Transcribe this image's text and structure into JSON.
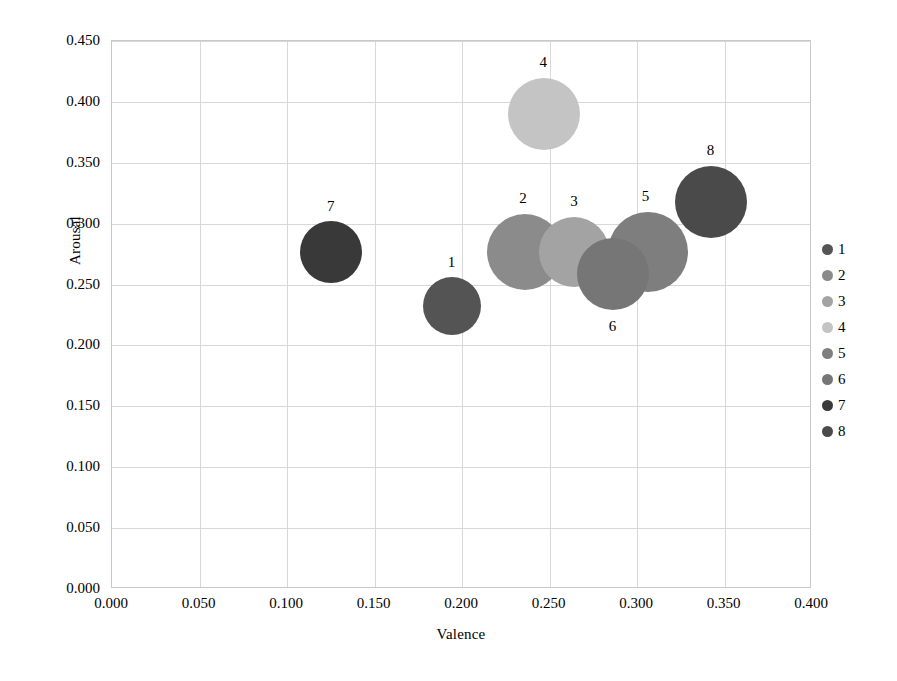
{
  "chart_data": {
    "type": "scatter",
    "title": "",
    "xlabel": "Valence",
    "ylabel": "Arousal",
    "xlim": [
      0.0,
      0.4
    ],
    "ylim": [
      0.0,
      0.45
    ],
    "xticks": [
      "0.000",
      "0.050",
      "0.100",
      "0.150",
      "0.200",
      "0.250",
      "0.300",
      "0.350",
      "0.400"
    ],
    "yticks": [
      "0.000",
      "0.050",
      "0.100",
      "0.150",
      "0.200",
      "0.250",
      "0.300",
      "0.350",
      "0.400",
      "0.450"
    ],
    "grid": true,
    "legend_position": "right",
    "legend_entries": [
      "1",
      "2",
      "3",
      "4",
      "5",
      "6",
      "7",
      "8"
    ],
    "points": [
      {
        "label": "1",
        "x": 0.194,
        "y": 0.232,
        "size": 58,
        "color": "#545454"
      },
      {
        "label": "2",
        "x": 0.236,
        "y": 0.277,
        "size": 76,
        "color": "#8b8b8b"
      },
      {
        "label": "3",
        "x": 0.264,
        "y": 0.277,
        "size": 70,
        "color": "#a3a3a3"
      },
      {
        "label": "4",
        "x": 0.247,
        "y": 0.39,
        "size": 72,
        "color": "#c4c4c4"
      },
      {
        "label": "5",
        "x": 0.306,
        "y": 0.277,
        "size": 80,
        "color": "#7e7e7e"
      },
      {
        "label": "6",
        "x": 0.286,
        "y": 0.259,
        "size": 72,
        "color": "#767676"
      },
      {
        "label": "7",
        "x": 0.125,
        "y": 0.277,
        "size": 62,
        "color": "#393939"
      },
      {
        "label": "8",
        "x": 0.342,
        "y": 0.318,
        "size": 72,
        "color": "#4a4a4a"
      }
    ],
    "point_label_offsets": [
      {
        "label": "1",
        "dx": 0,
        "dy": -44
      },
      {
        "label": "2",
        "dx": -2,
        "dy": -54
      },
      {
        "label": "3",
        "dx": 0,
        "dy": -51
      },
      {
        "label": "4",
        "dx": -1,
        "dy": -52
      },
      {
        "label": "5",
        "dx": -2,
        "dy": -56
      },
      {
        "label": "6",
        "dx": 0,
        "dy": 52
      },
      {
        "label": "7",
        "dx": 0,
        "dy": -46
      },
      {
        "label": "8",
        "dx": 0,
        "dy": -52
      }
    ],
    "legend_swatch_colors": [
      "#545454",
      "#8b8b8b",
      "#a3a3a3",
      "#c4c4c4",
      "#7e7e7e",
      "#767676",
      "#393939",
      "#4a4a4a"
    ]
  }
}
